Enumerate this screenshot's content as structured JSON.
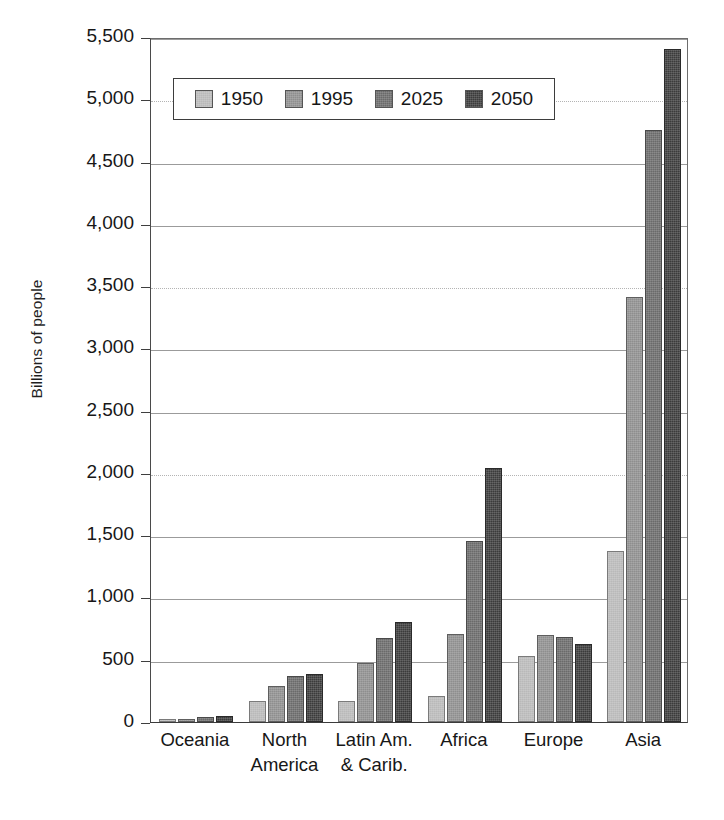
{
  "chart_data": {
    "type": "bar",
    "title": "",
    "xlabel": "",
    "ylabel": "Billions of people",
    "ylim": [
      0,
      5500
    ],
    "grid": true,
    "legend_position": "top-left-inside",
    "categories": [
      "Oceania",
      "North\nAmerica",
      "Latin Am.\n& Carib.",
      "Africa",
      "Europe",
      "Asia"
    ],
    "category_labels_flat": [
      "Oceania",
      "North America",
      "Latin Am. & Carib.",
      "Africa",
      "Europe",
      "Asia"
    ],
    "ytick_labels": [
      "0",
      "500",
      "1,000",
      "1,500",
      "2,000",
      "2,500",
      "3,000",
      "3,500",
      "4,000",
      "4,500",
      "5,000",
      "5,500"
    ],
    "ytick_values": [
      0,
      500,
      1000,
      1500,
      2000,
      2500,
      3000,
      3500,
      4000,
      4500,
      5000,
      5500
    ],
    "series": [
      {
        "name": "1950",
        "color": "#b9b9b9",
        "values": [
          13,
          172,
          167,
          212,
          530,
          1375
        ]
      },
      {
        "name": "1995",
        "color": "#8e8e8e",
        "values": [
          28,
          292,
          470,
          708,
          700,
          3410
        ]
      },
      {
        "name": "2025",
        "color": "#6a6a6a",
        "values": [
          41,
          370,
          672,
          1450,
          685,
          4750
        ]
      },
      {
        "name": "2050",
        "color": "#3b3b3b",
        "values": [
          46,
          384,
          800,
          2040,
          625,
          5400
        ]
      }
    ]
  },
  "legend": {
    "entries": [
      {
        "label": "1950",
        "color": "#b9b9b9"
      },
      {
        "label": "1995",
        "color": "#8e8e8e"
      },
      {
        "label": "2025",
        "color": "#6a6a6a"
      },
      {
        "label": "2050",
        "color": "#3b3b3b"
      }
    ]
  },
  "caption": {
    "text": ""
  }
}
